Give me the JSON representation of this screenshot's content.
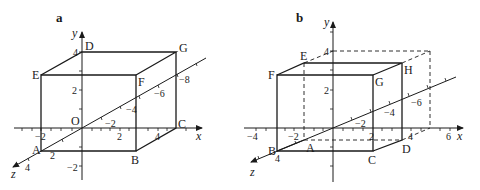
{
  "panels": [
    {
      "label": "a",
      "axes": {
        "x": "x",
        "y": "y",
        "z": "z",
        "origin": "O"
      },
      "vertices": {
        "A": "A",
        "B": "B",
        "C": "C",
        "D": "D",
        "E": "E",
        "F": "F",
        "G": "G"
      },
      "x_ticks": [
        "−2",
        "2",
        "4"
      ],
      "y_ticks": [
        "4",
        "2",
        "−2"
      ],
      "z_ticks": [
        "−2",
        "−4",
        "−6",
        "−8",
        "2",
        "4"
      ]
    },
    {
      "label": "b",
      "axes": {
        "x": "x",
        "y": "y",
        "z": "z"
      },
      "vertices": {
        "A": "A",
        "B": "B",
        "C": "C",
        "D": "D",
        "E": "E",
        "F": "F",
        "G": "G",
        "H": "H"
      },
      "x_ticks": [
        "−4",
        "−2",
        "2",
        "4",
        "6"
      ],
      "y_ticks": [
        "4",
        "2"
      ],
      "z_ticks": [
        "−2",
        "−4",
        "−6",
        "4"
      ]
    }
  ],
  "colors": {
    "line": "#1a1a1a",
    "background": "#ffffff"
  }
}
